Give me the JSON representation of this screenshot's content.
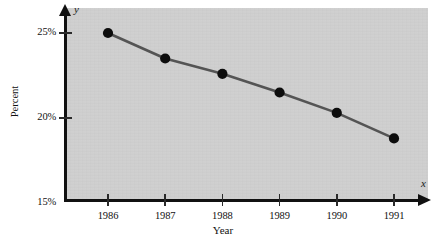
{
  "chart_data": {
    "type": "line",
    "title": "",
    "xlabel": "Year",
    "ylabel": "Percent",
    "x_axis_letter": "x",
    "y_axis_letter": "y",
    "categories": [
      "1986",
      "1987",
      "1988",
      "1989",
      "1990",
      "1991"
    ],
    "values": [
      25.0,
      23.5,
      22.6,
      21.5,
      20.3,
      18.8
    ],
    "series": [
      {
        "name": "Percent",
        "values": [
          25.0,
          23.5,
          22.6,
          21.5,
          20.3,
          18.8
        ]
      }
    ],
    "x_tick_labels": [
      "1986",
      "1987",
      "1988",
      "1989",
      "1990",
      "1991"
    ],
    "y_tick_labels": [
      "25%",
      "20%",
      "15%"
    ],
    "y_tick_values": [
      25,
      20,
      15
    ],
    "ylim": [
      15,
      26.5
    ],
    "xlim": [
      1985.3,
      1991.8
    ],
    "grid": false,
    "legend": false,
    "marker": "filled-circle",
    "colors": {
      "line": "#545454",
      "marker": "#0d0d0d",
      "panel_background": "#cfcfcf",
      "axis": "#111111",
      "figure_background": "#ffffff"
    }
  }
}
